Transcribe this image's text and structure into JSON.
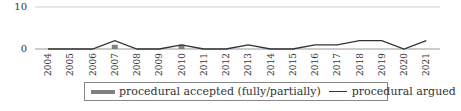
{
  "chart_data": {
    "type": "bar+line",
    "title": "",
    "xlabel": "",
    "ylabel": "",
    "ylim": [
      0,
      10
    ],
    "yticks": [
      0,
      10
    ],
    "grid": true,
    "legend_position": "bottom",
    "categories": [
      "2004",
      "2005",
      "2006",
      "2007",
      "2008",
      "2009",
      "2010",
      "2011",
      "2012",
      "2013",
      "2014",
      "2015",
      "2016",
      "2017",
      "2018",
      "2019",
      "2020",
      "2021"
    ],
    "series": [
      {
        "name": "procedural accepted (fully/partially)",
        "type": "bar",
        "color": "#808080",
        "values": [
          0,
          0,
          0,
          1,
          0,
          0,
          1,
          0,
          0,
          0,
          0,
          0,
          0,
          0,
          0,
          0,
          0,
          0
        ]
      },
      {
        "name": "procedural argued",
        "type": "line",
        "color": "#333333",
        "values": [
          0,
          0,
          0,
          2,
          0,
          0,
          1,
          0,
          0,
          1,
          0,
          0,
          1,
          1,
          2,
          2,
          0,
          2
        ]
      }
    ]
  },
  "axis": {
    "y_top_label": "10",
    "y_bottom_label": "0"
  },
  "legend": {
    "bar_label": "procedural accepted (fully/partially)",
    "line_label": "procedural argued"
  }
}
